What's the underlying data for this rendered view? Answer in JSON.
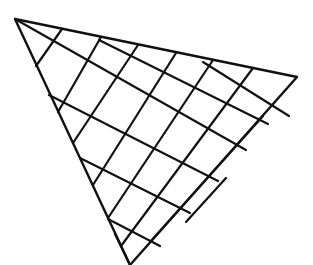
{
  "figure": {
    "stroke_color": "#111111",
    "background_color": "#ffffff",
    "triangle_vertices": {
      "apex_top_left": [
        15,
        19
      ],
      "right_corner": [
        297,
        77
      ],
      "bottom_corner": [
        130,
        265
      ]
    },
    "line_family_a_count": 9,
    "line_family_b_count": 6
  }
}
